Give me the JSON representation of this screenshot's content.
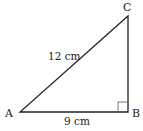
{
  "diagram": {
    "type": "right-triangle",
    "vertices": {
      "A": {
        "label": "A",
        "x": 20,
        "y": 112
      },
      "B": {
        "label": "B",
        "x": 128,
        "y": 112
      },
      "C": {
        "label": "C",
        "x": 128,
        "y": 16
      }
    },
    "sides": {
      "AC": {
        "label": "12 cm"
      },
      "AB": {
        "label": "9 cm"
      }
    },
    "right_angle_at": "B",
    "colors": {
      "stroke": "#222222",
      "marker": "#555555",
      "background": "#ffffff"
    }
  }
}
